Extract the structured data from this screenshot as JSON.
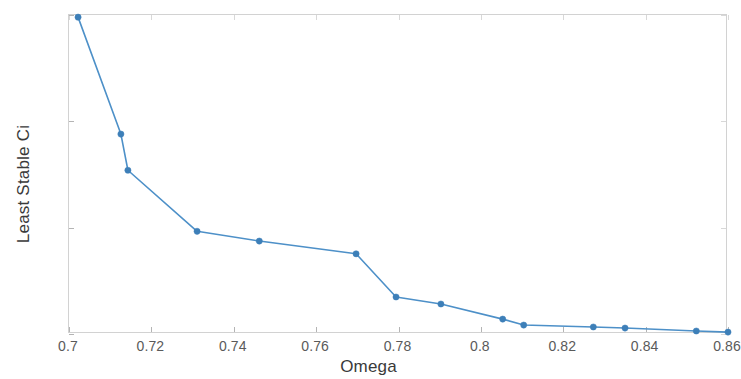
{
  "chart_data": {
    "type": "line",
    "title": "",
    "xlabel": "Omega",
    "ylabel": "Least Stable Ci",
    "xlim": [
      0.7,
      0.86
    ],
    "ylim": [
      0,
      0.015
    ],
    "grid": false,
    "legend": null,
    "marker": "circle",
    "line_color": "#4d90c8",
    "marker_color": "#3d7fb8",
    "axis_color": "#d2d2d2",
    "tick_label_color": "#5a5a5a",
    "axis_title_color": "#3a3a3a",
    "xticks": [
      0.7,
      0.72,
      0.74,
      0.76,
      0.78,
      0.8,
      0.82,
      0.84,
      0.86
    ],
    "xtick_labels": [
      "0.7",
      "0.72",
      "0.74",
      "0.76",
      "0.78",
      "0.8",
      "0.82",
      "0.84",
      "0.86"
    ],
    "yticks": [
      0,
      0.005,
      0.01,
      0.015
    ],
    "ytick_labels": [
      "0",
      "0.005",
      "0.01",
      "0.015"
    ],
    "series": [
      {
        "name": "Least Stable Ci",
        "x": [
          0.7022,
          0.7126,
          0.7143,
          0.7311,
          0.7462,
          0.7697,
          0.7794,
          0.7903,
          0.8053,
          0.8104,
          0.8273,
          0.835,
          0.8523,
          0.86
        ],
        "y": [
          0.0149,
          0.0094,
          0.0077,
          0.00483,
          0.00437,
          0.00377,
          0.00174,
          0.00141,
          0.0007,
          0.00042,
          0.00033,
          0.00028,
          0.00014,
          9e-05
        ]
      }
    ]
  }
}
